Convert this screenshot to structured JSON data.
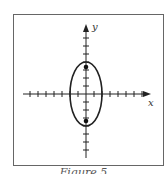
{
  "figure": {
    "caption": "Figure 5",
    "x_label": "x",
    "y_label": "y",
    "colors": {
      "stroke": "#222222",
      "frame": "#666666",
      "background": "#ffffff"
    }
  },
  "diagram": {
    "type": "ellipse_on_axes",
    "axes": {
      "x_ticks": [
        -7,
        -6,
        -5,
        -4,
        -3,
        -2,
        -1,
        1,
        2,
        3,
        4,
        5,
        6,
        7
      ],
      "y_ticks": [
        -7,
        -6,
        -5,
        -4,
        -3,
        -2,
        -1,
        1,
        2,
        3,
        4,
        5,
        6,
        7
      ]
    },
    "ellipse": {
      "center": [
        0,
        0
      ],
      "semi_major_vertical": 4,
      "semi_minor_horizontal": 2
    },
    "foci": [
      [
        0,
        3.46
      ],
      [
        0,
        -3.46
      ]
    ]
  }
}
